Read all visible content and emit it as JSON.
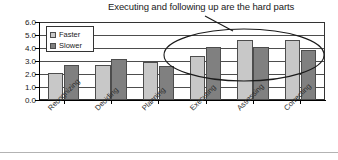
{
  "chart_data": {
    "type": "bar",
    "title": "Executing and following up are the hard parts",
    "xlabel": "",
    "ylabel": "",
    "ylim": [
      0.0,
      6.0
    ],
    "ytick_step": 1.0,
    "ytick_labels": [
      "6.0",
      "5.0",
      "4.0",
      "3.0",
      "2.0",
      "1.0",
      "0.0"
    ],
    "ytick_values": [
      6.0,
      5.0,
      4.0,
      3.0,
      2.0,
      1.0,
      0.0
    ],
    "grid": true,
    "grid_axis": "y",
    "legend_position": "upper-left-inside",
    "categories": [
      "Recognizing",
      "Deciding",
      "Planning",
      "Executing",
      "Assessing",
      "Correcting"
    ],
    "series": [
      {
        "name": "Faster",
        "color": "#c8c8c8",
        "values": [
          2.1,
          2.75,
          3.0,
          3.45,
          4.7,
          4.65
        ]
      },
      {
        "name": "Slower",
        "color": "#808080",
        "values": [
          2.75,
          3.2,
          2.65,
          4.15,
          4.1,
          3.9
        ]
      }
    ],
    "annotations": [
      {
        "type": "ellipse",
        "label": "highlight-ellipse",
        "covers_categories": [
          "Executing",
          "Assessing",
          "Correcting"
        ]
      },
      {
        "type": "leader-line",
        "label": "title-leader-line"
      }
    ]
  },
  "legend": {
    "items": [
      {
        "label": "Faster",
        "swatch": "faster-swatch"
      },
      {
        "label": "Slower",
        "swatch": "slower-swatch"
      }
    ]
  }
}
